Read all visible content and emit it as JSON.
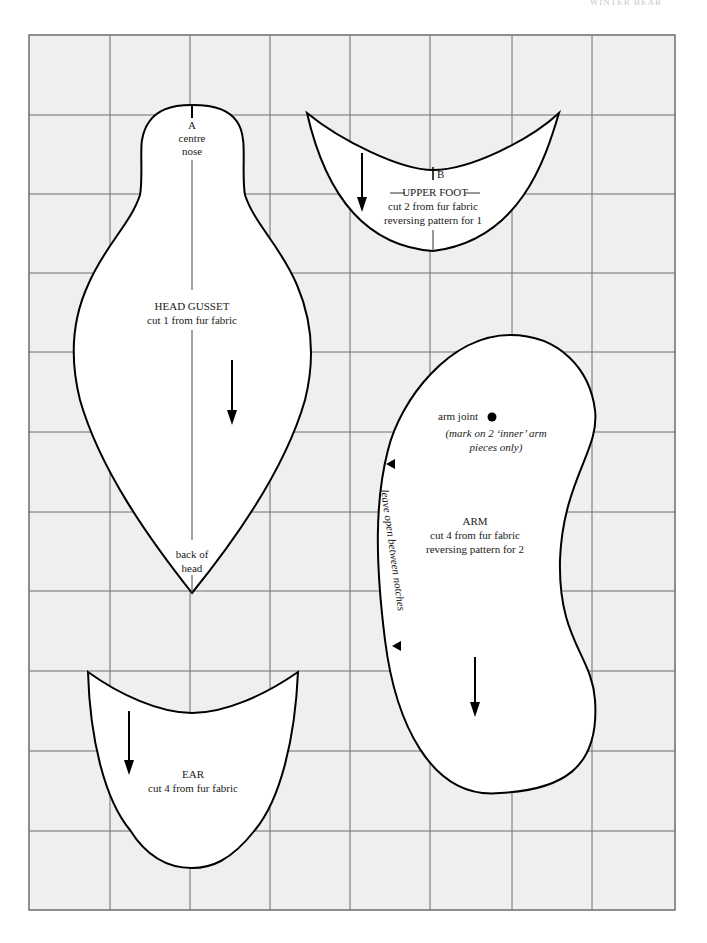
{
  "page": {
    "header": "WINTER BEAR",
    "grid": {
      "cols": 8,
      "rows": 11,
      "background": "#efefef",
      "line_color": "#6e6e6e"
    }
  },
  "pieces": {
    "head_gusset": {
      "marker": "A",
      "top_note_1": "centre",
      "top_note_2": "nose",
      "title": "HEAD GUSSET",
      "instruction": "cut 1 from fur fabric",
      "bottom_note_1": "back of",
      "bottom_note_2": "head"
    },
    "upper_foot": {
      "marker": "B",
      "title": "UPPER FOOT",
      "instruction_1": "cut 2 from fur fabric",
      "instruction_2": "reversing pattern for 1"
    },
    "arm": {
      "joint_label": "arm joint",
      "joint_note_1": "(mark on 2 ‘inner’ arm",
      "joint_note_2": "pieces only)",
      "side_note": "leave open between notches",
      "title": "ARM",
      "instruction_1": "cut 4 from fur fabric",
      "instruction_2": "reversing pattern for 2"
    },
    "ear": {
      "title": "EAR",
      "instruction": "cut 4 from fur fabric"
    }
  }
}
